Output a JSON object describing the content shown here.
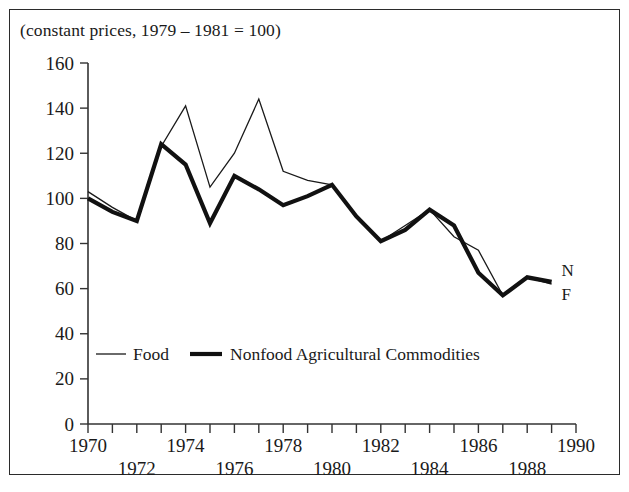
{
  "figure": {
    "caption": "(constant prices, 1979 – 1981 = 100)"
  },
  "legend": {
    "position": "inside-bottom-left",
    "items": [
      {
        "label": "Food",
        "style": "thin-line",
        "key": "F"
      },
      {
        "label": "Nonfood Agricultural Commodities",
        "style": "thick-line",
        "key": "N"
      }
    ]
  },
  "end_labels": {
    "nonfood": "N",
    "food": "F"
  },
  "axes": {
    "y_ticks": [
      "0",
      "20",
      "40",
      "60",
      "80",
      "100",
      "120",
      "140",
      "160"
    ],
    "x_ticks": [
      "1970",
      "1972",
      "1974",
      "1976",
      "1978",
      "1980",
      "1982",
      "1984",
      "1986",
      "1988",
      "1990"
    ]
  },
  "chart_data": {
    "type": "line",
    "title": "(constant prices, 1979 – 1981 = 100)",
    "xlabel": "",
    "ylabel": "",
    "xlim": [
      1970,
      1990
    ],
    "ylim": [
      0,
      160
    ],
    "grid": false,
    "legend_position": "inside-bottom-left",
    "x": [
      1970,
      1971,
      1972,
      1973,
      1974,
      1975,
      1976,
      1977,
      1978,
      1979,
      1980,
      1981,
      1982,
      1983,
      1984,
      1985,
      1986,
      1987,
      1988,
      1989
    ],
    "series": [
      {
        "name": "Food",
        "end_label": "F",
        "values": [
          103,
          96,
          90,
          123,
          141,
          105,
          120,
          144,
          112,
          108,
          106,
          92,
          81,
          88,
          95,
          83,
          77,
          57,
          65,
          62
        ]
      },
      {
        "name": "Nonfood Agricultural Commodities",
        "end_label": "N",
        "values": [
          100,
          94,
          90,
          124,
          115,
          89,
          110,
          104,
          97,
          101,
          106,
          92,
          81,
          86,
          95,
          88,
          67,
          57,
          65,
          63
        ]
      }
    ]
  }
}
